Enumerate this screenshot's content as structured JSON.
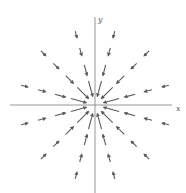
{
  "figure": {
    "title": "",
    "colors": {
      "axis": "#8a8a8a",
      "arrow": "#5a5a5a",
      "background": "#ffffff"
    },
    "origin": {
      "x": 95,
      "y": 105
    },
    "axes": {
      "x": {
        "label": "x",
        "from": 10,
        "to": 172,
        "label_pos": [
          176,
          111
        ]
      },
      "y": {
        "label": "y",
        "from": 17,
        "to": 193,
        "label_pos": [
          98,
          22
        ]
      }
    },
    "field": {
      "type": "radial-inward",
      "ray_angles_deg": [
        15,
        45,
        75,
        105,
        135,
        165,
        195,
        225,
        255,
        285,
        315,
        345
      ],
      "rings": [
        {
          "radius": 17,
          "length": 16
        },
        {
          "radius": 36,
          "length": 11
        },
        {
          "radius": 55,
          "length": 8
        },
        {
          "radius": 73,
          "length": 7
        }
      ]
    }
  }
}
